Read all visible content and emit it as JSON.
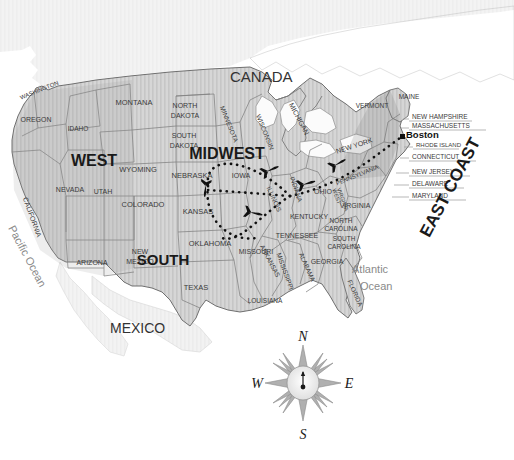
{
  "map": {
    "title": "United States Regions and Flight Routes",
    "background_color": "#ffffff",
    "land_fill": "#d4d4d4",
    "land_stroke": "#8c8c8c",
    "route_color": "#111111",
    "canada_label": "CANADA",
    "mexico_label": "MEXICO",
    "pacific_ocean_label": "Pacific Ocean",
    "atlantic_ocean_line1": "Atlantic",
    "atlantic_ocean_line2": "Ocean"
  },
  "regions": [
    {
      "id": "west",
      "label": "WEST",
      "x": 94,
      "y": 166,
      "size": 16
    },
    {
      "id": "midwest",
      "label": "MIDWEST",
      "x": 227,
      "y": 159,
      "size": 16
    },
    {
      "id": "south",
      "label": "SOUTH",
      "x": 163,
      "y": 265,
      "size": 15
    },
    {
      "id": "east-coast",
      "label": "EAST COAST",
      "x": 455,
      "y": 190,
      "size": 17,
      "rotate": -62
    }
  ],
  "states": [
    {
      "name": "WASHINGTON",
      "x": 40,
      "y": 92,
      "rotate": -22,
      "size": 6
    },
    {
      "name": "OREGON",
      "x": 36,
      "y": 122,
      "rotate": 0,
      "size": 7
    },
    {
      "name": "IDAHO",
      "x": 78,
      "y": 131,
      "rotate": 0,
      "size": 6.5
    },
    {
      "name": "MONTANA",
      "x": 134,
      "y": 105,
      "rotate": 0,
      "size": 7.5
    },
    {
      "name": "NORTH",
      "x": 185,
      "y": 108,
      "rotate": 0,
      "size": 7
    },
    {
      "name": "DAKOTA",
      "x": 185,
      "y": 118,
      "rotate": 0,
      "size": 7
    },
    {
      "name": "SOUTH",
      "x": 184,
      "y": 138,
      "rotate": 0,
      "size": 7
    },
    {
      "name": "DAKOTA",
      "x": 184,
      "y": 148,
      "rotate": 0,
      "size": 7
    },
    {
      "name": "WYOMING",
      "x": 138,
      "y": 172,
      "rotate": 0,
      "size": 7.5
    },
    {
      "name": "NEBRASKA",
      "x": 192,
      "y": 178,
      "rotate": 0,
      "size": 7.5
    },
    {
      "name": "NEVADA",
      "x": 70,
      "y": 192,
      "rotate": 0,
      "size": 7
    },
    {
      "name": "UTAH",
      "x": 103,
      "y": 194,
      "rotate": 0,
      "size": 7
    },
    {
      "name": "COLORADO",
      "x": 143,
      "y": 207,
      "rotate": 0,
      "size": 7.5
    },
    {
      "name": "CALIFORNIA",
      "x": 30,
      "y": 218,
      "rotate": 70,
      "size": 7
    },
    {
      "name": "KANSAS",
      "x": 198,
      "y": 214,
      "rotate": 0,
      "size": 7.5
    },
    {
      "name": "ARIZONA",
      "x": 92,
      "y": 265,
      "rotate": 0,
      "size": 7
    },
    {
      "name": "NEW",
      "x": 140,
      "y": 254,
      "rotate": 0,
      "size": 7
    },
    {
      "name": "MEXICO",
      "x": 140,
      "y": 264,
      "rotate": 0,
      "size": 7
    },
    {
      "name": "OKLAHOMA",
      "x": 210,
      "y": 246,
      "rotate": 0,
      "size": 7.5
    },
    {
      "name": "TEXAS",
      "x": 196,
      "y": 290,
      "rotate": 0,
      "size": 7.5
    },
    {
      "name": "MINNESOTA",
      "x": 227,
      "y": 125,
      "rotate": 68,
      "size": 6.5
    },
    {
      "name": "WISCONSIN",
      "x": 263,
      "y": 133,
      "rotate": 68,
      "size": 6.5
    },
    {
      "name": "IOWA",
      "x": 241,
      "y": 178,
      "rotate": 0,
      "size": 7
    },
    {
      "name": "MISSOURI",
      "x": 256,
      "y": 254,
      "rotate": 0,
      "size": 7
    },
    {
      "name": "ARKANSAS",
      "x": 268,
      "y": 262,
      "rotate": 62,
      "size": 6.5
    },
    {
      "name": "LOUISIANA",
      "x": 265,
      "y": 303,
      "rotate": 0,
      "size": 6.5
    },
    {
      "name": "MISSISSIPPI",
      "x": 283,
      "y": 272,
      "rotate": 70,
      "size": 6.5
    },
    {
      "name": "ALABAMA",
      "x": 305,
      "y": 268,
      "rotate": 66,
      "size": 6.5
    },
    {
      "name": "TENNESSEE",
      "x": 297,
      "y": 238,
      "rotate": 0,
      "size": 7
    },
    {
      "name": "KENTUCKY",
      "x": 309,
      "y": 219,
      "rotate": 0,
      "size": 7
    },
    {
      "name": "MICHIGAN",
      "x": 297,
      "y": 120,
      "rotate": 62,
      "size": 7
    },
    {
      "name": "INDIANA",
      "x": 294,
      "y": 190,
      "rotate": 72,
      "size": 6.5
    },
    {
      "name": "ILLINOIS",
      "x": 272,
      "y": 200,
      "rotate": 66,
      "size": 6.5
    },
    {
      "name": "OHIO",
      "x": 323,
      "y": 194,
      "rotate": 0,
      "size": 7
    },
    {
      "name": "GEORGIA",
      "x": 327,
      "y": 264,
      "rotate": 0,
      "size": 7
    },
    {
      "name": "FLORIDA",
      "x": 353,
      "y": 294,
      "rotate": 66,
      "size": 6.5
    },
    {
      "name": "SOUTH",
      "x": 344,
      "y": 241,
      "rotate": 0,
      "size": 6.5
    },
    {
      "name": "CAROLINA",
      "x": 344,
      "y": 249,
      "rotate": 0,
      "size": 6.5
    },
    {
      "name": "NORTH",
      "x": 341,
      "y": 223,
      "rotate": 0,
      "size": 6.5
    },
    {
      "name": "CAROLINA",
      "x": 341,
      "y": 231,
      "rotate": 0,
      "size": 6.5
    },
    {
      "name": "VIRGINIA",
      "x": 355,
      "y": 208,
      "rotate": 0,
      "size": 7
    },
    {
      "name": "WEST",
      "x": 335,
      "y": 197,
      "rotate": 70,
      "size": 5.5
    },
    {
      "name": "VIRGINIA",
      "x": 341,
      "y": 200,
      "rotate": 70,
      "size": 5.5
    },
    {
      "name": "PENNSYLVANIA",
      "x": 358,
      "y": 177,
      "rotate": -22,
      "size": 6
    },
    {
      "name": "NEW YORK",
      "x": 355,
      "y": 148,
      "rotate": -18,
      "size": 7
    },
    {
      "name": "VERMONT",
      "x": 372,
      "y": 108,
      "rotate": 0,
      "size": 6.5
    },
    {
      "name": "MAINE",
      "x": 409,
      "y": 99,
      "rotate": 0,
      "size": 6.5
    }
  ],
  "callout_states": [
    {
      "name": "NEW HAMPSHIRE",
      "x": 412,
      "y": 119,
      "size": 6.5
    },
    {
      "name": "MASSACHUSETTS",
      "x": 412,
      "y": 128,
      "size": 6.5
    },
    {
      "name": "RHODE ISLAND",
      "x": 416,
      "y": 147,
      "size": 6
    },
    {
      "name": "CONNECTICUT",
      "x": 412,
      "y": 159,
      "size": 6.5
    },
    {
      "name": "NEW JERSEY",
      "x": 412,
      "y": 174,
      "size": 6.5
    },
    {
      "name": "DELAWARE",
      "x": 412,
      "y": 186,
      "size": 6.5
    },
    {
      "name": "MARYLAND",
      "x": 412,
      "y": 198,
      "size": 6.5
    }
  ],
  "cities": [
    {
      "name": "Boston",
      "x": 406,
      "y": 138,
      "marker_x": 402,
      "marker_y": 137
    }
  ],
  "routes": {
    "description": "Dotted flight paths from a midwest hub in Indiana",
    "hub": {
      "x": 290,
      "y": 196
    },
    "segments": [
      {
        "id": "hub-to-boston",
        "from": "hub",
        "to": "Boston"
      },
      {
        "id": "hub-to-iowa-loop",
        "from": "hub",
        "to": "nebraska"
      },
      {
        "id": "hub-to-missouri",
        "from": "hub",
        "to": "kansas"
      }
    ],
    "plane_count": 4
  },
  "compass": {
    "north": "N",
    "east": "E",
    "south": "S",
    "west": "W",
    "center_x": 303,
    "center_y": 383
  }
}
